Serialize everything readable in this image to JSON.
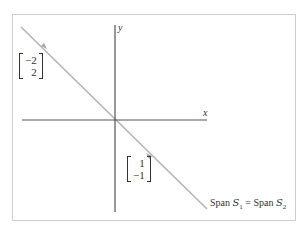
{
  "diagram": {
    "title": "",
    "axes": {
      "x_label": "x",
      "y_label": "y"
    },
    "line": {
      "description": "line through origin with direction (1,-1)",
      "color": "#b5b5b5"
    },
    "vectors": [
      {
        "name": "v1",
        "components": [
          "−2",
          "2"
        ],
        "label_position": "upper-left"
      },
      {
        "name": "v2",
        "components": [
          "1",
          "−1"
        ],
        "label_position": "lower-right"
      }
    ],
    "span_label": {
      "left_word": "Span",
      "left_set": "S",
      "left_sub": "1",
      "equals": "=",
      "right_word": "Span",
      "right_set": "S",
      "right_sub": "2"
    },
    "colors": {
      "axis": "#555555",
      "line": "#b5b5b5",
      "frame": "#cfcfcf",
      "text": "#333333"
    }
  }
}
